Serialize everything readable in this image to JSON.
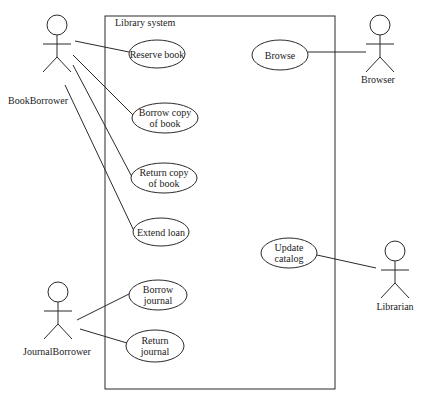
{
  "system": {
    "title": "Library system",
    "box": {
      "x": 105,
      "y": 16,
      "w": 230,
      "h": 373
    }
  },
  "actors": [
    {
      "id": "bookborrower",
      "name": "BookBorrower",
      "cx": 57,
      "headY": 25,
      "labelX": 38,
      "labelY": 104
    },
    {
      "id": "journalborrower",
      "name": "JournalBorrower",
      "cx": 58,
      "headY": 292,
      "labelX": 57,
      "labelY": 355
    },
    {
      "id": "browser",
      "name": "Browser",
      "cx": 380,
      "headY": 25,
      "labelX": 378,
      "labelY": 83
    },
    {
      "id": "librarian",
      "name": "Librarian",
      "cx": 395,
      "headY": 251,
      "labelX": 395,
      "labelY": 310
    }
  ],
  "use_cases": [
    {
      "id": "reserve-book",
      "lines": [
        "Reserve book"
      ],
      "cx": 157,
      "cy": 54,
      "rx": 28,
      "ry": 14
    },
    {
      "id": "borrow-copy-of-book",
      "lines": [
        "Borrow copy",
        "of book"
      ],
      "cx": 165,
      "cy": 118,
      "rx": 33,
      "ry": 15
    },
    {
      "id": "return-copy-of-book",
      "lines": [
        "Return copy",
        "of book"
      ],
      "cx": 164,
      "cy": 178,
      "rx": 33,
      "ry": 15
    },
    {
      "id": "extend-loan",
      "lines": [
        "Extend loan"
      ],
      "cx": 161,
      "cy": 232,
      "rx": 28,
      "ry": 14
    },
    {
      "id": "borrow-journal",
      "lines": [
        "Borrow",
        "journal"
      ],
      "cx": 158,
      "cy": 295,
      "rx": 29,
      "ry": 15
    },
    {
      "id": "return-journal",
      "lines": [
        "Return",
        "journal"
      ],
      "cx": 155,
      "cy": 346,
      "rx": 29,
      "ry": 16
    },
    {
      "id": "browse",
      "lines": [
        "Browse"
      ],
      "cx": 280,
      "cy": 55,
      "rx": 28,
      "ry": 15
    },
    {
      "id": "update-catalog",
      "lines": [
        "Update",
        "catalog"
      ],
      "cx": 289,
      "cy": 253,
      "rx": 28,
      "ry": 15
    }
  ],
  "associations": [
    {
      "from": "bookborrower",
      "to": "reserve-book",
      "x1": 75,
      "y1": 41,
      "x2": 129,
      "y2": 52
    },
    {
      "from": "bookborrower",
      "to": "borrow-copy-of-book",
      "x1": 73,
      "y1": 55,
      "x2": 133,
      "y2": 115
    },
    {
      "from": "bookborrower",
      "to": "return-copy-of-book",
      "x1": 73,
      "y1": 65,
      "x2": 132,
      "y2": 177
    },
    {
      "from": "bookborrower",
      "to": "extend-loan",
      "x1": 65,
      "y1": 85,
      "x2": 134,
      "y2": 231
    },
    {
      "from": "journalborrower",
      "to": "borrow-journal",
      "x1": 77,
      "y1": 320,
      "x2": 131,
      "y2": 293
    },
    {
      "from": "journalborrower",
      "to": "return-journal",
      "x1": 80,
      "y1": 329,
      "x2": 127,
      "y2": 343
    },
    {
      "from": "browser",
      "to": "browse",
      "x1": 308,
      "y1": 52,
      "x2": 366,
      "y2": 52
    },
    {
      "from": "librarian",
      "to": "update-catalog",
      "x1": 317,
      "y1": 255,
      "x2": 376,
      "y2": 268
    }
  ]
}
